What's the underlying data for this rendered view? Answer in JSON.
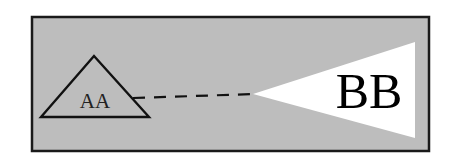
{
  "diagram": {
    "background_color": "#bdbdbd",
    "frame_color": "#1a1a1a",
    "wedge_color": "#ffffff",
    "frame": {
      "x": 32,
      "y": 17,
      "width": 397,
      "height": 134
    },
    "triangle": {
      "label": "AA",
      "points": [
        [
          94,
          56
        ],
        [
          41,
          117
        ],
        [
          149,
          117
        ]
      ],
      "label_pos": [
        95,
        108
      ],
      "label_size": 21
    },
    "connector": {
      "style": "dashed",
      "from": [
        133,
        98
      ],
      "to": [
        256,
        94
      ]
    },
    "wedge": {
      "label": "BB",
      "points": [
        [
          253,
          94
        ],
        [
          415,
          42
        ],
        [
          415,
          138
        ]
      ],
      "label_pos": [
        369,
        108
      ],
      "label_size": 50
    }
  }
}
